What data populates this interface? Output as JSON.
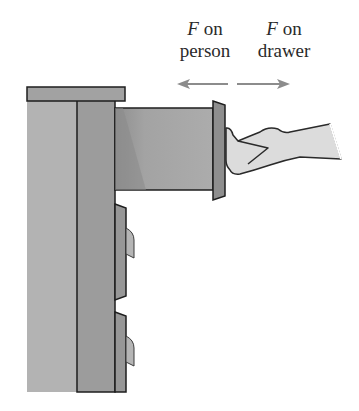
{
  "labels": {
    "person": {
      "symbol": "F",
      "line1_rest": " on",
      "line2": "person"
    },
    "drawer": {
      "symbol": "F",
      "line1_rest": " on",
      "line2": "drawer"
    }
  },
  "arrows": {
    "force_on_person": {
      "direction": "left",
      "color": "#8c8c8c"
    },
    "force_on_drawer": {
      "direction": "right",
      "color": "#8c8c8c"
    }
  },
  "colors": {
    "cabinet_side": "#b0b0b0",
    "cabinet_front": "#9a9a9a",
    "top": "#a0a0a0",
    "drawer_body": "#a8a8a8",
    "drawer_front": "#8e8e8e",
    "hand": "#dcdcdc",
    "outline": "#1e1e1e"
  }
}
